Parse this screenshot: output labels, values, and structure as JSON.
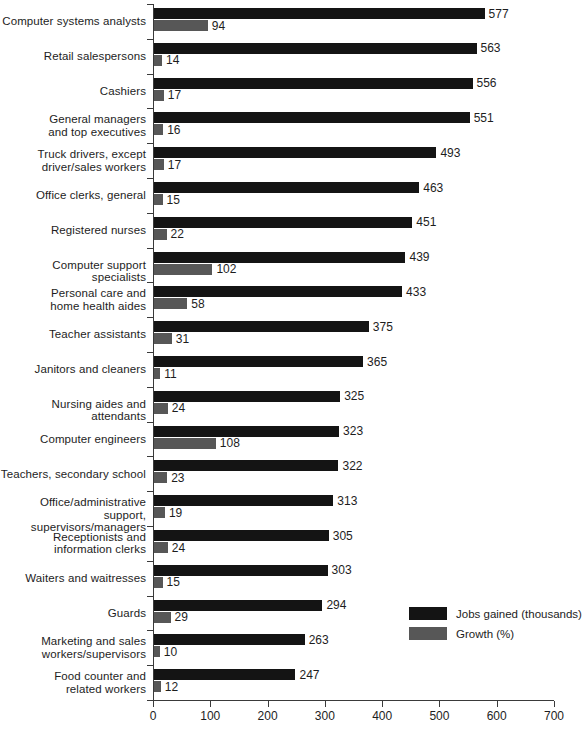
{
  "chart_data": {
    "type": "bar",
    "orientation": "horizontal",
    "title": "",
    "subtitle": "",
    "xlabel": "",
    "ylabel": "",
    "xlim": [
      0,
      700
    ],
    "xticks": [
      0,
      100,
      200,
      300,
      400,
      500,
      600,
      700
    ],
    "xtick_labels": [
      "0",
      "100",
      "200",
      "300",
      "400",
      "500",
      "600",
      "700"
    ],
    "grid": false,
    "legend_position": "inside-bottom-right",
    "categories": [
      "Computer systems analysts",
      "Retail salespersons",
      "Cashiers",
      "General managers\nand top executives",
      "Truck drivers, except\ndriver/sales workers",
      "Office clerks, general",
      "Registered nurses",
      "Computer support specialists",
      "Personal care and\nhome health aides",
      "Teacher assistants",
      "Janitors and cleaners",
      "Nursing aides and attendants",
      "Computer engineers",
      "Teachers, secondary school",
      "Office/administrative support,\nsupervisors/managers",
      "Receptionists and\ninformation clerks",
      "Waiters and waitresses",
      "Guards",
      "Marketing and sales\nworkers/supervisors",
      "Food counter and\nrelated workers"
    ],
    "series": [
      {
        "name": "Jobs gained (thousands)",
        "color": "#141414",
        "values": [
          577,
          563,
          556,
          551,
          493,
          463,
          451,
          439,
          433,
          375,
          365,
          325,
          323,
          322,
          313,
          305,
          303,
          294,
          263,
          247
        ]
      },
      {
        "name": "Growth (%)",
        "color": "#575757",
        "values": [
          94,
          14,
          17,
          16,
          17,
          15,
          22,
          102,
          58,
          31,
          11,
          24,
          108,
          23,
          19,
          24,
          15,
          29,
          10,
          12
        ]
      }
    ]
  },
  "legend": {
    "items": [
      {
        "label": "Jobs gained (thousands)",
        "swatch": "jobs"
      },
      {
        "label": "Growth (%)",
        "swatch": "growth"
      }
    ]
  },
  "colors": {
    "jobs": "#141414",
    "growth": "#575757",
    "axis": "#3a3a3a",
    "text": "#1d1d1d",
    "background": "#ffffff"
  }
}
